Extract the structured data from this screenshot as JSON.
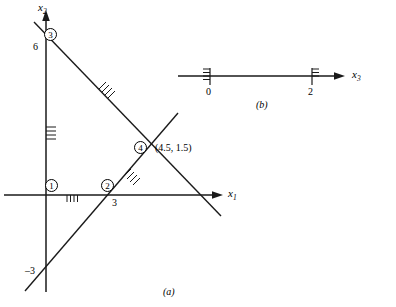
{
  "figure": {
    "panel_a": {
      "caption": "(a)",
      "axes": {
        "x_axis_label": "x",
        "x_axis_sub": "1",
        "y_axis_label": "x",
        "y_axis_sub": "2"
      },
      "tick_labels": [
        {
          "text": "6",
          "axis": "x2",
          "value": 6
        },
        {
          "text": "3",
          "axis": "x1",
          "value": 3
        },
        {
          "text": "–3",
          "axis": "x2",
          "value": -3
        }
      ],
      "constraint_markers": [
        {
          "label": "1",
          "name": "constraint-1"
        },
        {
          "label": "2",
          "name": "constraint-2"
        },
        {
          "label": "3",
          "name": "constraint-3"
        },
        {
          "label": "4",
          "name": "constraint-4"
        }
      ],
      "annotations": [
        {
          "text": "(4.5, 1.5)",
          "name": "intersection-point-label"
        }
      ]
    },
    "panel_b": {
      "caption": "(b)",
      "axis_label": "x",
      "axis_sub": "3",
      "tick_labels": [
        {
          "text": "0",
          "value": 0
        },
        {
          "text": "2",
          "value": 2
        }
      ]
    }
  },
  "style": {
    "line_color": "#1a1a1a",
    "background": "#ffffff"
  }
}
